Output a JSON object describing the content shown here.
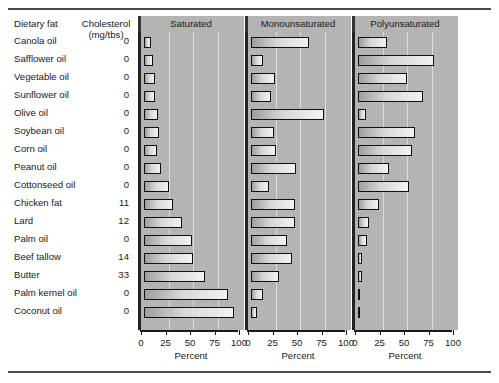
{
  "figure": {
    "label_column": {
      "header_primary": "Dietary fat",
      "header_secondary_line1": "Cholesterol",
      "header_secondary_line2": "(mg/tbs)"
    },
    "axis_title": "Percent",
    "panel_titles": {
      "saturated": "Saturated",
      "monounsaturated": "Monounsaturated",
      "polyunsaturated": "Polyunsaturated"
    }
  },
  "chart_data": {
    "type": "bar",
    "orientation": "horizontal",
    "title": "",
    "subtitle": "",
    "xlabel": "Percent",
    "ylabel": "Dietary fat",
    "xlim": [
      0,
      100
    ],
    "xticks": [
      0,
      25,
      50,
      75,
      100
    ],
    "xtick_labels": [
      "0",
      "25",
      "50",
      "75",
      "100"
    ],
    "grid": true,
    "grid_axis": "x",
    "legend": "none",
    "panel_layout": "three side-by-side panels sharing y categories",
    "categories": [
      "Canola oil",
      "Safflower oil",
      "Vegetable oil",
      "Sunflower oil",
      "Olive oil",
      "Soybean oil",
      "Corn oil",
      "Peanut oil",
      "Cottonseed oil",
      "Chicken fat",
      "Lard",
      "Palm oil",
      "Beef tallow",
      "Butter",
      "Palm kernel oil",
      "Coconut oil"
    ],
    "cholesterol_mg_per_tbs": [
      0,
      0,
      0,
      0,
      0,
      0,
      0,
      0,
      0,
      11,
      12,
      0,
      14,
      33,
      0,
      0
    ],
    "cholesterol_labels": [
      "0",
      "0",
      "0",
      "0",
      "0",
      "0",
      "0",
      "0",
      "0",
      "11",
      "12",
      "0",
      "14",
      "33",
      "0",
      "0"
    ],
    "series": [
      {
        "name": "Saturated",
        "values": [
          7,
          9,
          11,
          11,
          14,
          15,
          13,
          17,
          26,
          30,
          39,
          49,
          50,
          62,
          86,
          92
        ]
      },
      {
        "name": "Monounsaturated",
        "values": [
          59,
          12,
          24,
          20,
          74,
          23,
          25,
          46,
          18,
          45,
          45,
          37,
          42,
          29,
          12,
          6
        ]
      },
      {
        "name": "Polyunsaturated",
        "values": [
          30,
          78,
          50,
          66,
          8,
          58,
          55,
          32,
          52,
          21,
          11,
          9,
          4,
          4,
          2,
          2
        ]
      }
    ]
  }
}
